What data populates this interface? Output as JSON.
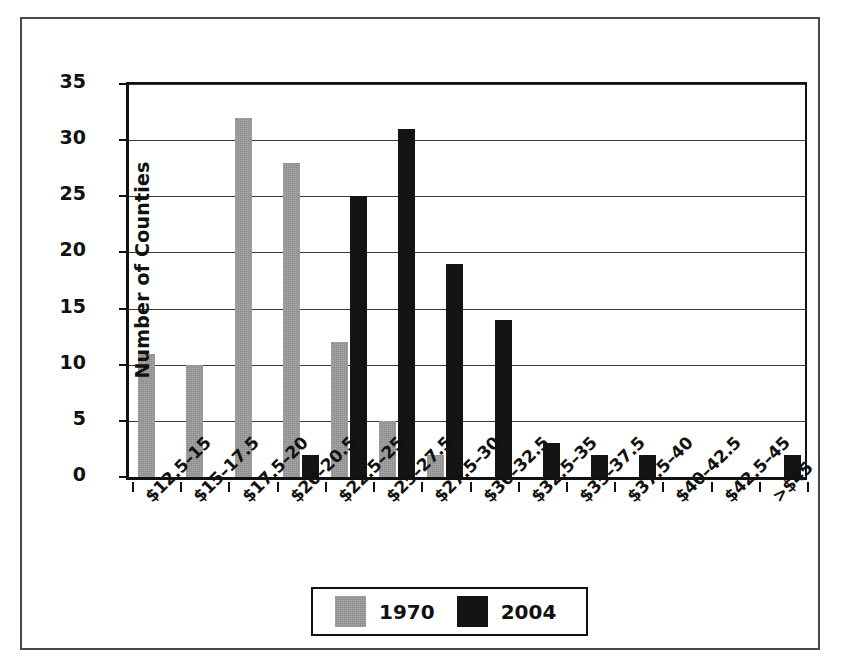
{
  "chart_data": {
    "type": "bar",
    "title": "",
    "xlabel": "",
    "ylabel": "Number of Counties",
    "ylim": [
      0,
      35
    ],
    "yticks": [
      0,
      5,
      10,
      15,
      20,
      25,
      30,
      35
    ],
    "grid": true,
    "legend_position": "bottom-center",
    "categories": [
      "$12.5–15",
      "$15–17.5",
      "$17.5–20",
      "$20–20.5",
      "$22.5–25",
      "$25–27.5",
      "$27.5–30",
      "$30–32.5",
      "$32.5–35",
      "$35–37.5",
      "$37.5–40",
      "$40–42.5",
      "$42.5–45",
      ">$45"
    ],
    "series": [
      {
        "name": "1970",
        "color": "#8c8c8c",
        "values": [
          11,
          10,
          32,
          28,
          12,
          5,
          2,
          0,
          0,
          0,
          0,
          0,
          0,
          0
        ]
      },
      {
        "name": "2004",
        "color": "#141414",
        "values": [
          0,
          0,
          0,
          2,
          25,
          31,
          19,
          14,
          3,
          2,
          2,
          0,
          0,
          2
        ]
      }
    ]
  },
  "legend": {
    "items": [
      {
        "label": "1970",
        "swatch": "gray-swatch"
      },
      {
        "label": "2004",
        "swatch": "black-swatch"
      }
    ]
  }
}
